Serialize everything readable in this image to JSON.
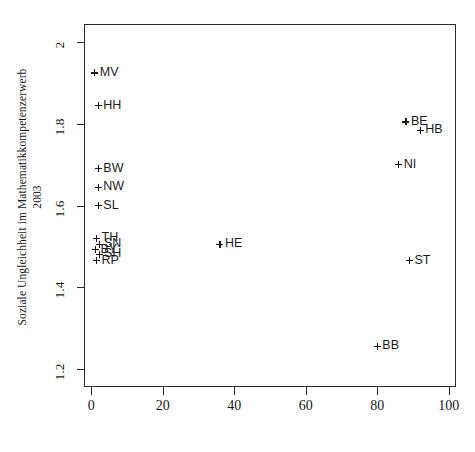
{
  "chart_data": {
    "type": "scatter",
    "title": "",
    "xlabel": "",
    "ylabel_line1": "Soziale Ungleichheit im Mathematikkompetenzerwerb",
    "ylabel_line2": "2003",
    "xlim": [
      -2,
      102
    ],
    "ylim": [
      1.155,
      2.045
    ],
    "xticks": [
      0,
      20,
      40,
      60,
      80,
      100
    ],
    "xtick_labels": [
      "0",
      "20",
      "40",
      "60",
      "80",
      "100"
    ],
    "yticks": [
      1.2,
      1.4,
      1.6,
      1.8,
      2
    ],
    "ytick_labels": [
      "1.2",
      "1.4",
      "1.6",
      "1.8",
      "2"
    ],
    "grid": false,
    "legend": "none",
    "marker": "plus",
    "points": [
      {
        "label": "MV",
        "x": 1.0,
        "y": 1.925
      },
      {
        "label": "HH",
        "x": 2.0,
        "y": 1.845
      },
      {
        "label": "BW",
        "x": 2.0,
        "y": 1.69
      },
      {
        "label": "NW",
        "x": 2.0,
        "y": 1.645
      },
      {
        "label": "SL",
        "x": 2.0,
        "y": 1.6
      },
      {
        "label": "TH",
        "x": 1.5,
        "y": 1.52
      },
      {
        "label": "SN",
        "x": 2.2,
        "y": 1.505
      },
      {
        "label": "BY",
        "x": 1.2,
        "y": 1.492
      },
      {
        "label": "SH",
        "x": 2.2,
        "y": 1.48
      },
      {
        "label": "RP",
        "x": 1.5,
        "y": 1.465
      },
      {
        "label": "HE",
        "x": 36.0,
        "y": 1.505
      },
      {
        "label": "BE",
        "x": 88.0,
        "y": 1.805
      },
      {
        "label": "HB",
        "x": 92.0,
        "y": 1.785
      },
      {
        "label": "NI",
        "x": 86.0,
        "y": 1.7
      },
      {
        "label": "ST",
        "x": 89.0,
        "y": 1.465
      },
      {
        "label": "BB",
        "x": 80.0,
        "y": 1.255
      }
    ]
  }
}
